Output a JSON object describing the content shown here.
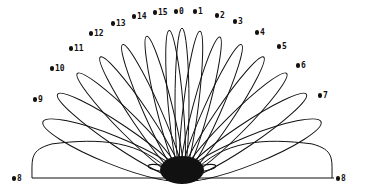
{
  "diagram": {
    "type": "polar beam radiation pattern",
    "stroke_color": "#111111",
    "background": "#ffffff",
    "origin": [
      182,
      178
    ],
    "baseline": {
      "x1": 32,
      "x2": 334,
      "y": 178
    },
    "beams": [
      {
        "label": "8",
        "angle_deg": 180,
        "length": 150,
        "width": 56,
        "side": "left",
        "label_pos": [
          12,
          175
        ]
      },
      {
        "label": "9",
        "angle_deg": 158,
        "length": 150,
        "width": 28,
        "label_pos": [
          33,
          96
        ]
      },
      {
        "label": "10",
        "angle_deg": 146,
        "length": 150,
        "width": 22,
        "label_pos": [
          50,
          65
        ]
      },
      {
        "label": "11",
        "angle_deg": 135,
        "length": 148,
        "width": 20,
        "label_pos": [
          69,
          45
        ]
      },
      {
        "label": "12",
        "angle_deg": 124,
        "length": 146,
        "width": 18,
        "label_pos": [
          89,
          30
        ]
      },
      {
        "label": "13",
        "angle_deg": 114,
        "length": 146,
        "width": 17,
        "label_pos": [
          111,
          20
        ]
      },
      {
        "label": "14",
        "angle_deg": 104,
        "length": 146,
        "width": 16,
        "label_pos": [
          132,
          13
        ]
      },
      {
        "label": "15",
        "angle_deg": 95,
        "length": 148,
        "width": 15,
        "label_pos": [
          153,
          9
        ]
      },
      {
        "label": "0",
        "angle_deg": 90,
        "length": 150,
        "width": 14,
        "label_pos": [
          174,
          8
        ]
      },
      {
        "label": "1",
        "angle_deg": 83,
        "length": 148,
        "width": 15,
        "label_pos": [
          193,
          8
        ]
      },
      {
        "label": "2",
        "angle_deg": 75,
        "length": 146,
        "width": 16,
        "label_pos": [
          215,
          12
        ]
      },
      {
        "label": "3",
        "angle_deg": 66,
        "length": 146,
        "width": 17,
        "label_pos": [
          233,
          18
        ]
      },
      {
        "label": "4",
        "angle_deg": 56,
        "length": 146,
        "width": 18,
        "label_pos": [
          255,
          29
        ]
      },
      {
        "label": "5",
        "angle_deg": 45,
        "length": 148,
        "width": 20,
        "label_pos": [
          277,
          43
        ]
      },
      {
        "label": "6",
        "angle_deg": 34,
        "length": 150,
        "width": 22,
        "label_pos": [
          296,
          62
        ]
      },
      {
        "label": "7",
        "angle_deg": 22,
        "length": 150,
        "width": 28,
        "label_pos": [
          318,
          92
        ]
      },
      {
        "label": "8",
        "angle_deg": 0,
        "length": 150,
        "width": 56,
        "side": "right",
        "label_pos": [
          336,
          175
        ]
      }
    ]
  }
}
